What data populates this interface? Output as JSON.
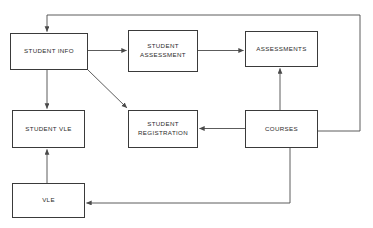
{
  "diagram": {
    "type": "entity-flow-diagram",
    "canvas": {
      "width": 373,
      "height": 228,
      "background": "#ffffff"
    },
    "style": {
      "box_border_color": "#3a3a3a",
      "box_fill": "#ffffff",
      "connector_color": "#4a4a4a",
      "text_color": "#2b2b2b"
    },
    "nodes": [
      {
        "id": "student-info",
        "label": "STUDENT INFO",
        "x": 10,
        "y": 33,
        "width": 78,
        "height": 37
      },
      {
        "id": "student-assessment",
        "label": "STUDENT\nASSESSMENT",
        "x": 128,
        "y": 30,
        "width": 70,
        "height": 42
      },
      {
        "id": "assessments",
        "label": "ASSESSMENTS",
        "x": 245,
        "y": 31,
        "width": 73,
        "height": 36
      },
      {
        "id": "student-vle",
        "label": "STUDENT VLE",
        "x": 12,
        "y": 110,
        "width": 73,
        "height": 38
      },
      {
        "id": "student-registration",
        "label": "STUDENT\nREGISTRATION",
        "x": 128,
        "y": 110,
        "width": 70,
        "height": 38
      },
      {
        "id": "courses",
        "label": "COURSES",
        "x": 245,
        "y": 110,
        "width": 73,
        "height": 38
      },
      {
        "id": "vle",
        "label": "VLE",
        "x": 12,
        "y": 183,
        "width": 73,
        "height": 35
      }
    ],
    "edges": [
      {
        "id": "edge-student-info-to-student-assessment",
        "from": "student-info",
        "to": "student-assessment",
        "kind": "straight-horizontal",
        "arrow": true
      },
      {
        "id": "edge-student-assessment-to-assessments",
        "from": "student-assessment",
        "to": "assessments",
        "kind": "straight-horizontal",
        "arrow": true
      },
      {
        "id": "edge-student-info-to-student-vle",
        "from": "student-info",
        "to": "student-vle",
        "kind": "straight-vertical",
        "arrow": true
      },
      {
        "id": "edge-student-info-to-student-registration",
        "from": "student-info",
        "to": "student-registration",
        "kind": "diagonal",
        "arrow": true
      },
      {
        "id": "edge-courses-to-student-registration",
        "from": "courses",
        "to": "student-registration",
        "kind": "straight-horizontal-left",
        "arrow": true
      },
      {
        "id": "edge-courses-to-assessments",
        "from": "courses",
        "to": "assessments",
        "kind": "straight-vertical-up",
        "arrow": true
      },
      {
        "id": "edge-vle-to-student-vle",
        "from": "vle",
        "to": "student-vle",
        "kind": "straight-vertical-up",
        "arrow": true
      },
      {
        "id": "edge-courses-to-student-info",
        "from": "courses",
        "to": "student-info",
        "kind": "routed-top",
        "arrow": true
      },
      {
        "id": "edge-courses-to-vle",
        "from": "courses",
        "to": "vle",
        "kind": "routed-bottom",
        "arrow": true
      }
    ]
  }
}
